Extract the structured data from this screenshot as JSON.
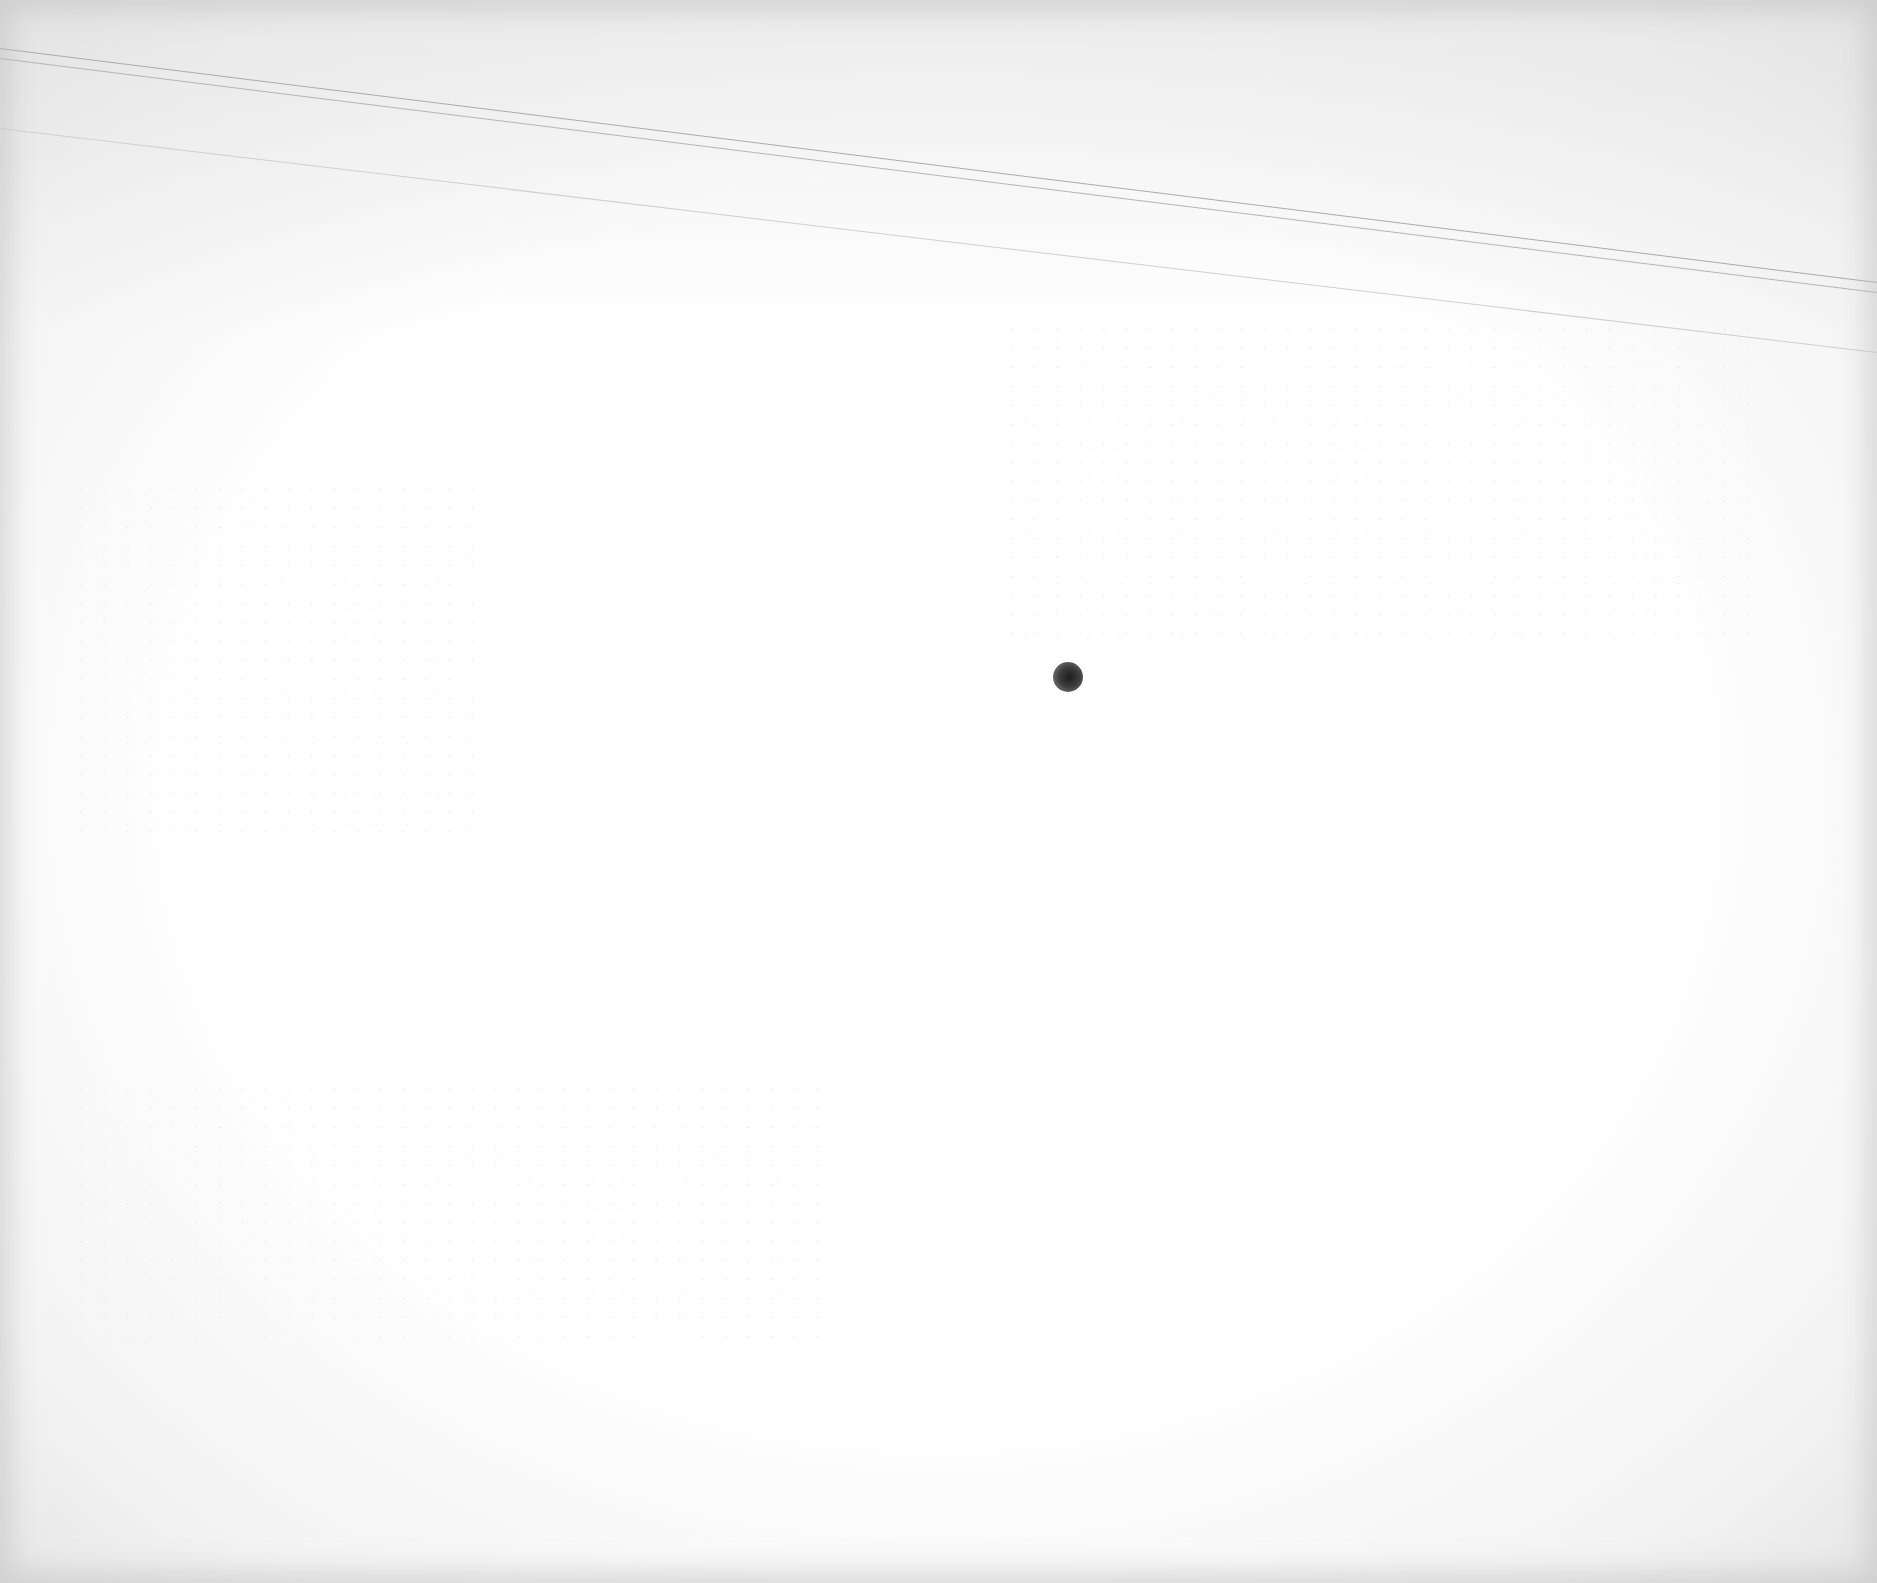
{
  "page": {
    "type": "blank-scanned-page",
    "background_color": "#ffffff",
    "edge_shade_color": "#e6e6e6",
    "text_content": [],
    "legible_text": "none"
  },
  "marks": {
    "scan_lines": [
      {
        "x1": 0,
        "y1": 48,
        "x2": 1877,
        "y2": 282,
        "color": "#aaaaaa"
      },
      {
        "x1": 0,
        "y1": 58,
        "x2": 1877,
        "y2": 292,
        "color": "#b4b4b4"
      },
      {
        "x1": 0,
        "y1": 128,
        "x2": 1877,
        "y2": 352,
        "color": "#cfcfcf"
      }
    ],
    "dot": {
      "cx": 1068,
      "cy": 677,
      "diameter": 30,
      "color": "#2a2a2a"
    }
  }
}
